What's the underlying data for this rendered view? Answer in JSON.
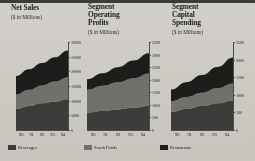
{
  "background_color": "#cbc9c2",
  "legend": {
    "items": [
      {
        "label": "Beverages",
        "color": "#3b3b39"
      },
      {
        "label": "Snack Foods",
        "color": "#6f6f6b"
      },
      {
        "label": "Restaurants",
        "color": "#1c1c1a"
      }
    ]
  },
  "charts": [
    {
      "title": "Net Sales",
      "subtitle": "($ in Millions)",
      "chart_data": {
        "type": "area",
        "title": "Net Sales",
        "subtitle": "($ in Millions)",
        "stacked": true,
        "xlabel": "",
        "ylabel": "",
        "categories": [
          "90",
          "91",
          "92",
          "93",
          "94"
        ],
        "x": [
          90,
          91,
          92,
          93,
          94
        ],
        "ylim": [
          0,
          30000
        ],
        "yticks": [
          0,
          5000,
          10000,
          15000,
          20000,
          25000,
          30000
        ],
        "ytick_labels": [
          "0",
          "5000",
          "10000",
          "15000",
          "20000",
          "25000",
          "30000"
        ],
        "grid": false,
        "legend_position": "bottom",
        "series": [
          {
            "name": "Beverages",
            "color": "#3b3b39",
            "values": [
              7200,
              8200,
              9100,
              9700,
              10500
            ]
          },
          {
            "name": "Snack Foods",
            "color": "#6f6f6b",
            "values": [
              4900,
              5500,
              6100,
              6800,
              7500
            ]
          },
          {
            "name": "Restaurants",
            "color": "#1c1c1a",
            "values": [
              6300,
              7000,
              7600,
              8300,
              9100
            ]
          }
        ],
        "totals": [
          18400,
          20700,
          22800,
          24800,
          27100
        ]
      }
    },
    {
      "title": "Segment\nOperating\nProfits",
      "subtitle": "($ in Millions)",
      "chart_data": {
        "type": "area",
        "title": "Segment Operating Profits",
        "subtitle": "($ in Millions)",
        "stacked": true,
        "xlabel": "",
        "ylabel": "",
        "categories": [
          "90",
          "91",
          "92",
          "93",
          "94"
        ],
        "x": [
          90,
          91,
          92,
          93,
          94
        ],
        "ylim": [
          0,
          3500
        ],
        "yticks": [
          0,
          500,
          1000,
          1500,
          2000,
          2500,
          3000,
          3500
        ],
        "ytick_labels": [
          "0",
          "500",
          "1000",
          "1500",
          "2000",
          "2500",
          "3000",
          "3500"
        ],
        "grid": false,
        "legend_position": "bottom",
        "series": [
          {
            "name": "Beverages",
            "color": "#3b3b39",
            "values": [
              700,
              760,
              820,
              880,
              950
            ]
          },
          {
            "name": "Snack Foods",
            "color": "#6f6f6b",
            "values": [
              900,
              1000,
              1080,
              1180,
              1300
            ]
          },
          {
            "name": "Restaurants",
            "color": "#1c1c1a",
            "values": [
              420,
              500,
              600,
              700,
              800
            ]
          }
        ],
        "totals": [
          2020,
          2260,
          2500,
          2760,
          3050
        ]
      }
    },
    {
      "title": "Segment\nCapital\nSpending",
      "subtitle": "($ in Millions)",
      "chart_data": {
        "type": "area",
        "title": "Segment Capital Spending",
        "subtitle": "($ in Millions)",
        "stacked": true,
        "xlabel": "",
        "ylabel": "",
        "categories": [
          "90",
          "91",
          "92",
          "93",
          "94"
        ],
        "x": [
          90,
          91,
          92,
          93,
          94
        ],
        "ylim": [
          0,
          2500
        ],
        "yticks": [
          0,
          500,
          1000,
          1500,
          2000,
          2500
        ],
        "ytick_labels": [
          "0",
          "500",
          "1000",
          "1500",
          "2000",
          "2500"
        ],
        "grid": false,
        "legend_position": "bottom",
        "series": [
          {
            "name": "Beverages",
            "color": "#3b3b39",
            "values": [
              520,
              600,
              680,
              760,
              840
            ]
          },
          {
            "name": "Snack Foods",
            "color": "#6f6f6b",
            "values": [
              300,
              340,
              380,
              430,
              480
            ]
          },
          {
            "name": "Restaurants",
            "color": "#1c1c1a",
            "values": [
              330,
              420,
              500,
              600,
              740
            ]
          }
        ],
        "totals": [
          1150,
          1360,
          1560,
          1790,
          2060
        ]
      }
    }
  ]
}
